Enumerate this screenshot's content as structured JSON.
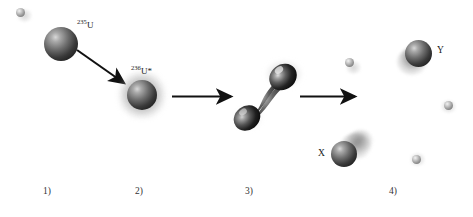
{
  "figure": {
    "name": "nuclear-fission-stages-diagram",
    "background_color": "#ffffff",
    "width": 473,
    "height": 217
  },
  "labels": {
    "uranium235": {
      "mass_number": "235",
      "symbol": "U"
    },
    "uranium236_excited": {
      "mass_number": "236",
      "symbol": "U*"
    },
    "fragment_heavy": "Y",
    "fragment_light": "X"
  },
  "stages": [
    {
      "id": "stage-1",
      "caption": "1)",
      "x": 43
    },
    {
      "id": "stage-2",
      "caption": "2)",
      "x": 135
    },
    {
      "id": "stage-3",
      "caption": "3)",
      "x": 245
    },
    {
      "id": "stage-4",
      "caption": "4)",
      "x": 389
    }
  ],
  "nuclei": [
    {
      "name": "uranium-235-nucleus",
      "x": 44,
      "y": 27,
      "size": 34
    },
    {
      "name": "compound-nucleus-u236",
      "x": 127,
      "y": 80,
      "size": 30
    },
    {
      "name": "fission-fragment-y",
      "x": 405,
      "y": 40,
      "size": 27
    },
    {
      "name": "fission-fragment-x",
      "x": 331,
      "y": 141,
      "size": 26
    }
  ],
  "neutrons": [
    {
      "name": "incident-neutron",
      "x": 16,
      "y": 8,
      "size": 9
    },
    {
      "name": "emitted-neutron-1",
      "x": 345,
      "y": 58,
      "size": 9
    },
    {
      "name": "emitted-neutron-2",
      "x": 444,
      "y": 101,
      "size": 9
    },
    {
      "name": "emitted-neutron-3",
      "x": 412,
      "y": 155,
      "size": 9
    }
  ],
  "arrows": [
    {
      "name": "arrow-capture",
      "x1": 78,
      "y1": 52,
      "x2": 131,
      "y2": 89,
      "type": "diagonal"
    },
    {
      "name": "arrow-deformation",
      "x1": 173,
      "y1": 96,
      "x2": 238,
      "y2": 96,
      "type": "horizontal"
    },
    {
      "name": "arrow-scission",
      "x1": 301,
      "y1": 96,
      "x2": 362,
      "y2": 96,
      "type": "horizontal"
    }
  ],
  "colors": {
    "nucleus_dark": "#1b1b1b",
    "nucleus_highlight": "#d8d8d8",
    "neutron_gray": "#9a9a9a",
    "arrow_black": "#111111",
    "text": "#1a1a1a",
    "background": "#ffffff"
  }
}
